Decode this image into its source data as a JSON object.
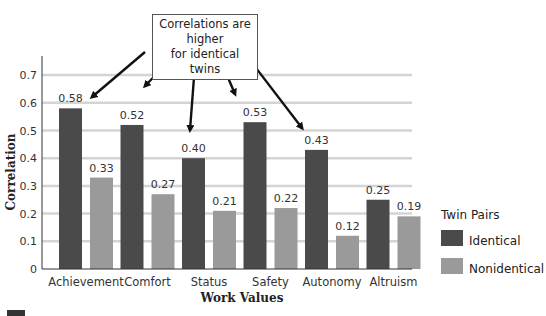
{
  "chart_data": {
    "type": "bar",
    "title": "",
    "xlabel": "Work Values",
    "ylabel": "Correlation",
    "ylim": [
      0,
      0.75
    ],
    "yticks": [
      0,
      0.1,
      0.2,
      0.3,
      0.4,
      0.5,
      0.6,
      0.7
    ],
    "ytick_labels": [
      "0",
      "0.1",
      "0.2",
      "0.3",
      "0.4",
      "0.5",
      "0.6",
      "0.7"
    ],
    "grid": true,
    "categories": [
      "Achievement",
      "Comfort",
      "Status",
      "Safety",
      "Autonomy",
      "Altruism"
    ],
    "series": [
      {
        "name": "Identical",
        "color": "#4a4a4a",
        "values": [
          0.58,
          0.52,
          0.4,
          0.53,
          0.43,
          0.25
        ],
        "labels": [
          "0.58",
          "0.52",
          "0.40",
          "0.53",
          "0.43",
          "0.25"
        ]
      },
      {
        "name": "Nonidentical",
        "color": "#9a9a9a",
        "values": [
          0.33,
          0.27,
          0.21,
          0.22,
          0.12,
          0.19
        ],
        "labels": [
          "0.33",
          "0.27",
          "0.21",
          "0.22",
          "0.12",
          "0.19"
        ]
      }
    ],
    "legend": {
      "title": "Twin Pairs",
      "placement": "right"
    },
    "annotation": {
      "line1": "Correlations are higher",
      "line2": "for identical twins",
      "points_to_series": "Identical",
      "points_to_categories": [
        "Achievement",
        "Comfort",
        "Status",
        "Safety",
        "Autonomy"
      ]
    },
    "gridline_color": "#d4d4d4"
  }
}
